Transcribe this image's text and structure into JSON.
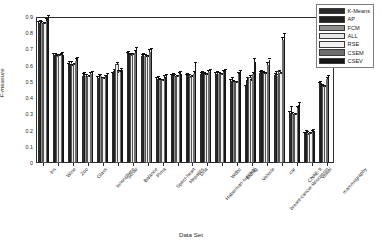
{
  "chart_data": {
    "type": "bar",
    "title": "",
    "xlabel": "Data Set",
    "ylabel": "F-measure",
    "ylim": [
      0,
      0.9
    ],
    "yticks": [
      "0",
      "0.1",
      "0.2",
      "0.3",
      "0.4",
      "0.5",
      "0.6",
      "0.7",
      "0.8",
      "0.9"
    ],
    "grid": false,
    "legend_position": "upper-right",
    "error_bars": true,
    "categories": [
      "Iris",
      "Wine",
      "Zoo",
      "Glass",
      "Ionosphere",
      "Sonar",
      "Balance",
      "Pima",
      "Spect-heart",
      "Hepatitis",
      "Dna",
      "Haberman-survival",
      "Wdbc",
      "Bldiag",
      "Vehicle",
      "breast-cancer-Wisconsin",
      "car",
      "CNAE-9",
      "Vowel",
      "mammography"
    ],
    "series": [
      {
        "name": "K-Means",
        "color": "#2a2a2a",
        "values": [
          0.855,
          0.657,
          0.6,
          0.533,
          0.52,
          0.543,
          0.665,
          0.655,
          0.51,
          0.53,
          0.53,
          0.545,
          0.545,
          0.5,
          0.465,
          0.548,
          0.538,
          0.3,
          0.175,
          0.478
        ],
        "errors": [
          0.008,
          0.006,
          0.006,
          0.007,
          0.006,
          0.006,
          0.006,
          0.006,
          0.006,
          0.006,
          0.006,
          0.006,
          0.006,
          0.006,
          0.006,
          0.006,
          0.006,
          0.008,
          0.006,
          0.007
        ]
      },
      {
        "name": "AP",
        "color": "#1f1f1f",
        "values": [
          0.862,
          0.66,
          0.607,
          0.536,
          0.518,
          0.56,
          0.668,
          0.66,
          0.515,
          0.535,
          0.536,
          0.548,
          0.548,
          0.508,
          0.505,
          0.552,
          0.545,
          0.318,
          0.18,
          0.485
        ],
        "errors": [
          0.01,
          0.008,
          0.008,
          0.01,
          0.02,
          0.01,
          0.008,
          0.008,
          0.01,
          0.008,
          0.008,
          0.008,
          0.008,
          0.01,
          0.01,
          0.008,
          0.01,
          0.02,
          0.01,
          0.01
        ]
      },
      {
        "name": "FCM",
        "color": "#8d8d8d",
        "values": [
          0.858,
          0.655,
          0.61,
          0.53,
          0.528,
          0.548,
          0.66,
          0.652,
          0.505,
          0.528,
          0.532,
          0.542,
          0.542,
          0.495,
          0.495,
          0.546,
          0.53,
          0.295,
          0.178,
          0.47
        ],
        "errors": [
          0.008,
          0.006,
          0.006,
          0.006,
          0.006,
          0.006,
          0.006,
          0.006,
          0.006,
          0.006,
          0.006,
          0.006,
          0.006,
          0.006,
          0.006,
          0.006,
          0.006,
          0.006,
          0.006,
          0.006
        ]
      },
      {
        "name": "ALL",
        "color": "#e9e9e9",
        "values": [
          0.845,
          0.65,
          0.595,
          0.52,
          0.51,
          0.6,
          0.655,
          0.645,
          0.5,
          0.52,
          0.52,
          0.535,
          0.535,
          0.488,
          0.52,
          0.54,
          0.555,
          0.285,
          0.168,
          0.46
        ],
        "errors": [
          0.008,
          0.006,
          0.006,
          0.006,
          0.006,
          0.01,
          0.006,
          0.006,
          0.006,
          0.006,
          0.006,
          0.006,
          0.006,
          0.006,
          0.008,
          0.006,
          0.006,
          0.006,
          0.006,
          0.006
        ]
      },
      {
        "name": "RSE",
        "color": "#f2f2f2",
        "values": [
          0.848,
          0.652,
          0.598,
          0.522,
          0.512,
          0.552,
          0.658,
          0.648,
          0.502,
          0.522,
          0.522,
          0.538,
          0.538,
          0.49,
          0.498,
          0.542,
          0.54,
          0.288,
          0.17,
          0.462
        ],
        "errors": [
          0.008,
          0.006,
          0.006,
          0.006,
          0.006,
          0.006,
          0.006,
          0.006,
          0.006,
          0.006,
          0.006,
          0.006,
          0.006,
          0.006,
          0.006,
          0.006,
          0.006,
          0.006,
          0.006,
          0.006
        ]
      },
      {
        "name": "CSEM",
        "color": "#6e6e6e",
        "values": [
          0.87,
          0.658,
          0.625,
          0.54,
          0.525,
          0.555,
          0.672,
          0.68,
          0.52,
          0.54,
          0.545,
          0.552,
          0.552,
          0.54,
          0.54,
          0.6,
          0.755,
          0.33,
          0.185,
          0.51
        ],
        "errors": [
          0.01,
          0.008,
          0.01,
          0.008,
          0.008,
          0.008,
          0.01,
          0.01,
          0.008,
          0.008,
          0.008,
          0.008,
          0.008,
          0.01,
          0.01,
          0.01,
          0.012,
          0.01,
          0.008,
          0.01
        ]
      },
      {
        "name": "CSEV",
        "color": "#161616",
        "values": [
          0.888,
          0.662,
          0.632,
          0.545,
          0.53,
          0.565,
          0.69,
          0.682,
          0.525,
          0.545,
          0.6,
          0.558,
          0.558,
          0.55,
          0.618,
          0.62,
          0.778,
          0.35,
          0.19,
          0.52
        ],
        "errors": [
          0.01,
          0.008,
          0.012,
          0.01,
          0.01,
          0.01,
          0.012,
          0.012,
          0.01,
          0.01,
          0.012,
          0.01,
          0.01,
          0.012,
          0.014,
          0.012,
          0.014,
          0.012,
          0.01,
          0.012
        ]
      }
    ]
  }
}
